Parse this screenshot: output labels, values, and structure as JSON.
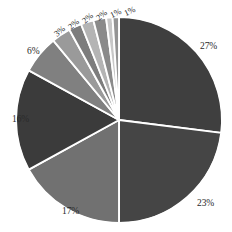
{
  "chart_data": {
    "type": "pie",
    "title": "",
    "subtitle": "",
    "xlabel": "",
    "ylabel": "",
    "legend": "none",
    "grid": false,
    "start_angle_deg": 0,
    "direction": "clockwise",
    "units": "percent",
    "total": 100,
    "categories": [
      "Slice 1",
      "Slice 2",
      "Slice 3",
      "Slice 4",
      "Slice 5",
      "Slice 6",
      "Slice 7",
      "Slice 8",
      "Slice 9",
      "Slice 10",
      "Slice 11"
    ],
    "values": [
      27,
      23,
      17,
      16,
      6,
      3,
      2,
      2,
      2,
      1,
      1
    ],
    "labels": [
      "27%",
      "23%",
      "17%",
      "16%",
      "6%",
      "3%",
      "2%",
      "2%",
      "2%",
      "1%",
      "1%"
    ],
    "colors": [
      "#3f3f3f",
      "#454545",
      "#717171",
      "#3b3b3b",
      "#808080",
      "#9a9a9a",
      "#7d7d7d",
      "#b4b4b4",
      "#8a8a8a",
      "#c8c8c8",
      "#949494"
    ],
    "slice_border_color": "#ffffff",
    "background_color": "#ffffff",
    "label_color": "#2a2a2a"
  },
  "slices": [
    {
      "label": "27%",
      "value": 27,
      "color": "#3f3f3f",
      "label_x": 200,
      "label_y": 42,
      "rotate": 0,
      "size": "normal"
    },
    {
      "label": "23%",
      "value": 23,
      "color": "#454545",
      "label_x": 197,
      "label_y": 199,
      "rotate": 0,
      "size": "normal"
    },
    {
      "label": "17%",
      "value": 17,
      "color": "#717171",
      "label_x": 62,
      "label_y": 207,
      "rotate": 0,
      "size": "normal"
    },
    {
      "label": "16%",
      "value": 16,
      "color": "#3b3b3b",
      "label_x": 12,
      "label_y": 115,
      "rotate": 0,
      "size": "normal"
    },
    {
      "label": "6%",
      "value": 6,
      "color": "#808080",
      "label_x": 27,
      "label_y": 47,
      "rotate": 0,
      "size": "normal"
    },
    {
      "label": "3%",
      "value": 3,
      "color": "#9a9a9a",
      "label_x": 54,
      "label_y": 27,
      "rotate": -40,
      "size": "small"
    },
    {
      "label": "2%",
      "value": 2,
      "color": "#7d7d7d",
      "label_x": 68,
      "label_y": 20,
      "rotate": -40,
      "size": "small"
    },
    {
      "label": "2%",
      "value": 2,
      "color": "#b4b4b4",
      "label_x": 82,
      "label_y": 14,
      "rotate": -40,
      "size": "small"
    },
    {
      "label": "2%",
      "value": 2,
      "color": "#8a8a8a",
      "label_x": 96,
      "label_y": 11,
      "rotate": -40,
      "size": "small"
    },
    {
      "label": "1%",
      "value": 1,
      "color": "#c8c8c8",
      "label_x": 110,
      "label_y": 9,
      "rotate": -25,
      "size": "small"
    },
    {
      "label": "1%",
      "value": 1,
      "color": "#949494",
      "label_x": 124,
      "label_y": 7,
      "rotate": -25,
      "size": "small"
    }
  ],
  "geometry": {
    "center_x": 119,
    "center_y": 120,
    "radius": 103
  }
}
